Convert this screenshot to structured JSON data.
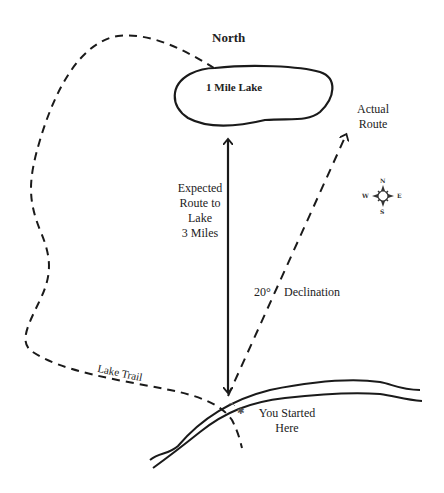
{
  "title": "North",
  "lake": {
    "name": "1 Mile Lake"
  },
  "routes": {
    "actual": {
      "label_line1": "Actual",
      "label_line2": "Route"
    },
    "expected": {
      "label_line1": "Expected",
      "label_line2": "Route to",
      "label_line3": "Lake",
      "distance": "3 Miles"
    }
  },
  "declination": {
    "degrees": "20°",
    "label": "Declination"
  },
  "trail": {
    "label": "Lake Trail"
  },
  "start": {
    "label_line1": "You Started",
    "label_line2": "Here"
  },
  "compass": {
    "n": "N",
    "s": "S",
    "e": "E",
    "w": "W"
  },
  "colors": {
    "ink": "#1a1a1a",
    "background": "#ffffff"
  }
}
